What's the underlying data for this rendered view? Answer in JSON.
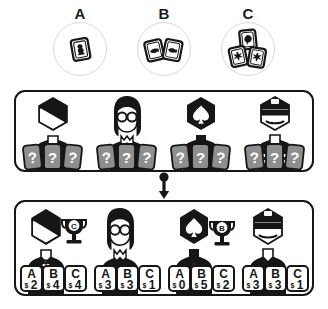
{
  "legend": {
    "items": [
      {
        "label": "A",
        "icon": "one-card-icon",
        "card_count": 1
      },
      {
        "label": "B",
        "icon": "two-cards-icon",
        "card_count": 2
      },
      {
        "label": "C",
        "icon": "three-cards-icon",
        "card_count": 3
      }
    ]
  },
  "flow": {
    "arrow_icon": "down-arrow-icon"
  },
  "hidden_panel": {
    "players": [
      {
        "id": "player-1",
        "avatar": "suit-bowtie-avatar",
        "cards": [
          "?",
          "?",
          "?"
        ]
      },
      {
        "id": "player-2",
        "avatar": "glasses-long-hair-avatar",
        "cards": [
          "?",
          "?",
          "?"
        ]
      },
      {
        "id": "player-3",
        "avatar": "spade-head-avatar",
        "cards": [
          "?",
          "?",
          "?"
        ]
      },
      {
        "id": "player-4",
        "avatar": "visor-cap-avatar",
        "cards": [
          "?",
          "?",
          "?"
        ]
      }
    ]
  },
  "revealed_panel": {
    "players": [
      {
        "id": "player-1",
        "avatar": "suit-bowtie-avatar",
        "trophy": "A",
        "has_trophy": true,
        "cards": [
          {
            "label": "A",
            "currency": "$",
            "value": "7"
          },
          {
            "label": "B",
            "currency": "$",
            "value": "0"
          },
          {
            "label": "C",
            "currency": "$",
            "value": "0"
          }
        ]
      },
      {
        "id": "player-2",
        "avatar": "glasses-long-hair-avatar",
        "trophy": "C",
        "has_trophy": true,
        "cards": [
          {
            "label": "A",
            "currency": "$",
            "value": "2"
          },
          {
            "label": "B",
            "currency": "$",
            "value": "4"
          },
          {
            "label": "C",
            "currency": "$",
            "value": "4"
          }
        ]
      },
      {
        "id": "player-3",
        "avatar": "spade-head-avatar",
        "trophy": "B",
        "has_trophy": true,
        "cards": [
          {
            "label": "A",
            "currency": "$",
            "value": "0"
          },
          {
            "label": "B",
            "currency": "$",
            "value": "5"
          },
          {
            "label": "C",
            "currency": "$",
            "value": "2"
          }
        ]
      },
      {
        "id": "player-4",
        "avatar": "visor-cap-avatar",
        "trophy": "",
        "has_trophy": false,
        "cards": [
          {
            "label": "A",
            "currency": "$",
            "value": "3"
          },
          {
            "label": "B",
            "currency": "$",
            "value": "3"
          },
          {
            "label": "C",
            "currency": "$",
            "value": "1"
          }
        ]
      }
    ]
  },
  "colors": {
    "ink": "#161616",
    "card_hidden_fill": "#8e8e8e",
    "card_hidden_text": "#ffffff",
    "card_revealed_fill": "#ffffff",
    "background": "#ffffff",
    "legend_circle_stroke": "#d8d8d8"
  }
}
